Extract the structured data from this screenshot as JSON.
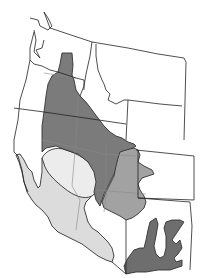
{
  "map": {
    "title": "",
    "subject": "Western United States distribution regions",
    "colors": {
      "background": "#ffffff",
      "border": "#222222",
      "region_dark": "#7b7b7b",
      "region_medium": "#a2a2a2",
      "region_light": "#dcdcdc",
      "region_lightest": "#ececec",
      "region_southeast_dark": "#6e6e6e"
    },
    "regions": [
      {
        "name": "great-basin-region",
        "shade": "dark"
      },
      {
        "name": "colorado-plateau-region",
        "shade": "medium"
      },
      {
        "name": "mojave-sonoran-region",
        "shade": "light"
      },
      {
        "name": "central-valley-oval-region",
        "shade": "lightest"
      },
      {
        "name": "southeast-new-mexico-region",
        "shade": "dark"
      }
    ]
  }
}
